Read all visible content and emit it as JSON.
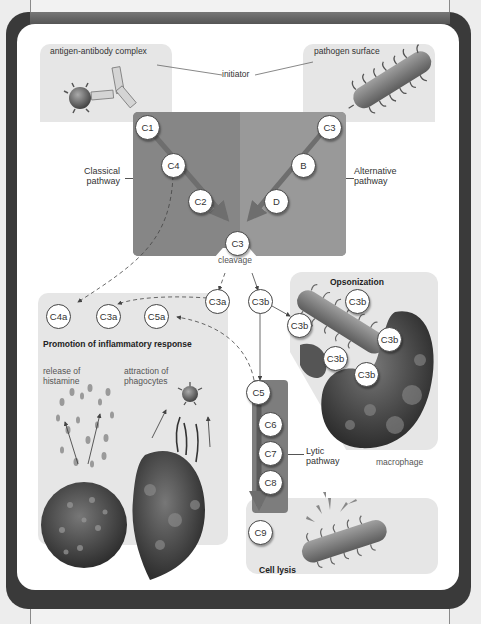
{
  "initiators": {
    "left_label": "antigen-antibody complex",
    "center_label": "initiator",
    "right_label": "pathogen surface"
  },
  "pathways": {
    "classical": {
      "label_line1": "Classical",
      "label_line2": "pathway",
      "nodes": [
        "C1",
        "C4",
        "C2"
      ]
    },
    "alternative": {
      "label_line1": "Alternative",
      "label_line2": "pathway",
      "nodes": [
        "C3",
        "B",
        "D"
      ]
    },
    "convergence": {
      "node": "C3",
      "label": "cleavage"
    },
    "products": {
      "c3a": "C3a",
      "c3b": "C3b"
    },
    "lytic": {
      "label_line1": "Lytic",
      "label_line2": "pathway",
      "nodes": [
        "C5",
        "C6",
        "C7",
        "C8",
        "C9"
      ]
    }
  },
  "inflammation": {
    "title": "Promotion of inflammatory response",
    "mediators": [
      "C4a",
      "C3a",
      "C5a"
    ],
    "left_caption_line1": "release of",
    "left_caption_line2": "histamine",
    "right_caption_line1": "attraction of",
    "right_caption_line2": "phagocytes"
  },
  "opsonization": {
    "title": "Opsonization",
    "bound_nodes": [
      "C3b",
      "C3b",
      "C3b",
      "C3b",
      "C3b"
    ],
    "cell_label": "macrophage"
  },
  "lysis": {
    "title": "Cell lysis"
  },
  "colors": {
    "frame": "#3a3a3a",
    "panel": "#ffffff",
    "region": "#e6e6e6",
    "core_left": "#868686",
    "core_right": "#999999",
    "arrow": "#6e6e6e"
  }
}
